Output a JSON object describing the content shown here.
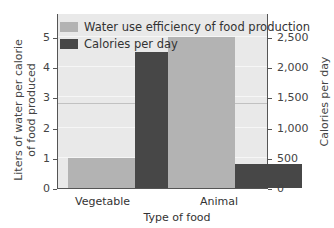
{
  "chart_data": {
    "type": "bar",
    "title": "",
    "xlabel": "Type of food",
    "ylabel": "Liters of water per calorie of food produced",
    "ylabel_right": "Calories per day",
    "categories": [
      "Vegetable",
      "Animal"
    ],
    "series": [
      {
        "name": "Water use efficiency of food production",
        "axis": "left",
        "values": [
          1.0,
          5.0
        ],
        "color": "#b3b3b3"
      },
      {
        "name": "Calories per day",
        "axis": "right",
        "values": [
          2250,
          400
        ],
        "color": "#474747"
      }
    ],
    "ylim": [
      0,
      5.8
    ],
    "ylim_right": [
      0,
      2900
    ],
    "yticks": [
      "0",
      "1",
      "2",
      "3",
      "4",
      "5"
    ],
    "yticks_right": [
      "0",
      "500",
      "1,000",
      "1,500",
      "2,000",
      "2,500"
    ],
    "grid": true,
    "legend_position": "upper left"
  },
  "labels": {
    "xlabel": "Type of food",
    "ylabel_line1": "Liters of water per calorie",
    "ylabel_line2": "of food produced",
    "ylabel_right": "Calories per day",
    "cat0": "Vegetable",
    "cat1": "Animal",
    "legend0": "Water use efficiency of food production",
    "legend1": "Calories per day"
  }
}
